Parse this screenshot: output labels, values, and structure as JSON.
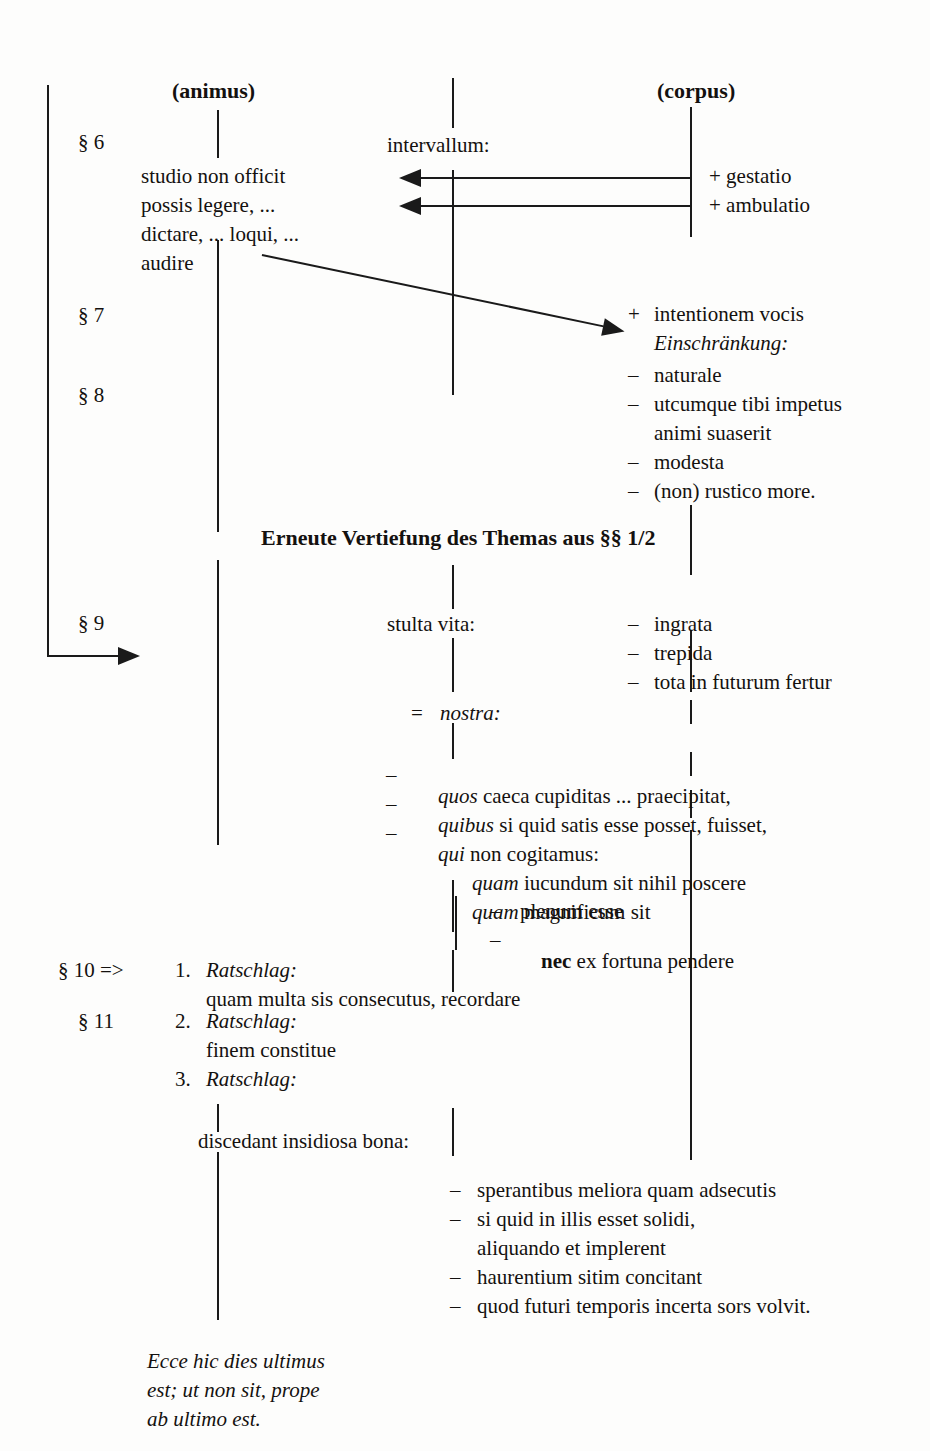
{
  "page": {
    "background": "#fdfdfc",
    "ink": "#14110f"
  },
  "columns": {
    "animus_label": "(animus)",
    "corpus_label": "(corpus)"
  },
  "section_markers": {
    "s6": "§ 6",
    "s7": "§ 7",
    "s8": "§ 8",
    "s9": "§ 9",
    "s10": "§ 10 =>",
    "s11": "§ 11"
  },
  "middle": {
    "intervallum": "intervallum:",
    "stulta_vita": "stulta vita:",
    "equals_sign": "=",
    "nostra": "nostra:",
    "discedant": "discedant insidiosa bona:"
  },
  "animus_block": {
    "lines": [
      "studio non officit",
      "possis legere, ...",
      "dictare, ... loqui, ...",
      "audire"
    ]
  },
  "corpus_block": {
    "gestatio": "+ gestatio",
    "ambulatio": "+ ambulatio",
    "plus_sign": "+",
    "intentionem": "intentionem vocis",
    "einschraenkung": "Einschränkung:",
    "restrictions": [
      {
        "dash": "–",
        "text": "naturale"
      },
      {
        "dash": "–",
        "text": "utcumque tibi impetus"
      },
      {
        "dash": "",
        "text": "animi suaserit",
        "continuation": true
      },
      {
        "dash": "–",
        "text": "modesta"
      },
      {
        "dash": "–",
        "text": "(non) rustico more."
      }
    ]
  },
  "heading": {
    "text": "Erneute Vertiefung des Themas aus §§ 1/2"
  },
  "vita_attributes": [
    {
      "dash": "–",
      "text": "ingrata"
    },
    {
      "dash": "–",
      "text": "trepida"
    },
    {
      "dash": "–",
      "text": "tota in futurum fertur"
    }
  ],
  "nostra_items": [
    {
      "dash": "–",
      "em": "quos",
      "rest": " caeca cupiditas ... praecipitat,"
    },
    {
      "dash": "–",
      "em": "quibus",
      "rest": " si quid satis esse posset, fuisset,"
    },
    {
      "dash": "–",
      "em": "qui",
      "rest": " non cogitamus:"
    }
  ],
  "quam_lines": [
    {
      "em": "quam",
      "rest": " iucundum sit nihil poscere"
    },
    {
      "em": "quam",
      "rest": " magnificum sit"
    }
  ],
  "quam_subitems": [
    {
      "dash": "–",
      "bold": "",
      "text": "plenum esse"
    },
    {
      "dash": "–",
      "bold": "nec",
      "text": " ex fortuna pendere"
    }
  ],
  "ratschlaege": [
    {
      "num": "1.",
      "label": "Ratschlag:",
      "body": "quam multa sis consecutus, recordare"
    },
    {
      "num": "2.",
      "label": "Ratschlag:",
      "body": "finem constitue"
    },
    {
      "num": "3.",
      "label": "Ratschlag:",
      "body": ""
    }
  ],
  "bona_items": [
    {
      "dash": "–",
      "text": "sperantibus meliora quam adsecutis"
    },
    {
      "dash": "–",
      "text": "si quid in illis esset solidi,"
    },
    {
      "dash": "",
      "text": "aliquando et implerent",
      "continuation": true
    },
    {
      "dash": "–",
      "text": "haurentium sitim concitant"
    },
    {
      "dash": "–",
      "text": "quod futuri temporis incerta sors volvit."
    }
  ],
  "closing_quote": {
    "lines": [
      "Ecce hic dies ultimus",
      "est; ut non sit, prope",
      "ab ultimo est."
    ]
  }
}
